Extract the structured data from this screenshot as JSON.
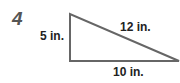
{
  "problem": {
    "number": "4",
    "shape": "right-triangle",
    "labels": {
      "left_side": "5 in.",
      "hypotenuse": "12 in.",
      "bottom_side": "10 in."
    }
  },
  "colors": {
    "line": "#666666",
    "text": "#222222",
    "number": "#555555"
  }
}
